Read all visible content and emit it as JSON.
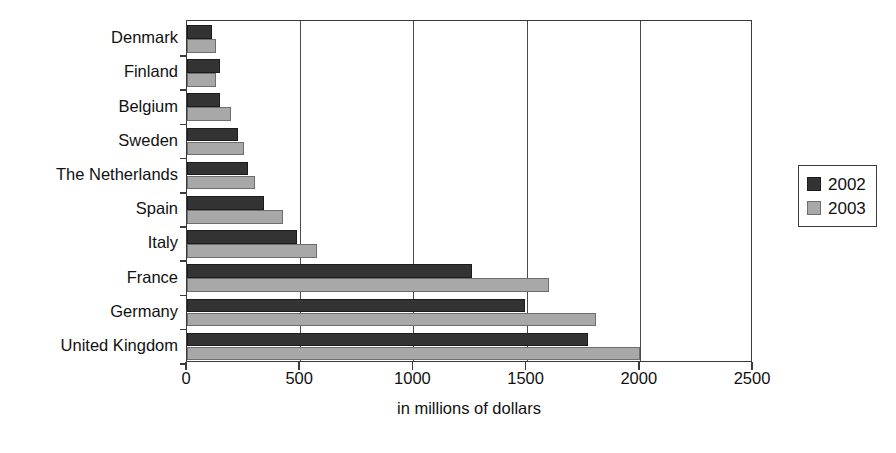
{
  "chart_data": {
    "type": "bar",
    "orientation": "horizontal",
    "title": "",
    "xlabel": "in millions of dollars",
    "ylabel": "",
    "xlim": [
      0,
      2500
    ],
    "xticks": [
      0,
      500,
      1000,
      1500,
      2000,
      2500
    ],
    "xtick_labels": [
      "0",
      "500",
      "1000",
      "1500",
      "2000",
      "2500"
    ],
    "grid": true,
    "legend_position": "right",
    "categories": [
      "Denmark",
      "Finland",
      "Belgium",
      "Sweden",
      "The Netherlands",
      "Spain",
      "Italy",
      "France",
      "Germany",
      "United Kingdom"
    ],
    "series": [
      {
        "name": "2002",
        "color": "#333333",
        "values": [
          110,
          145,
          145,
          225,
          270,
          340,
          485,
          1260,
          1495,
          1770
        ]
      },
      {
        "name": "2003",
        "color": "#a8a8a8",
        "values": [
          130,
          130,
          195,
          250,
          300,
          425,
          575,
          1600,
          1805,
          2000
        ]
      }
    ]
  },
  "legend": {
    "entries": [
      {
        "label": "2002",
        "swatch": "dark-swatch"
      },
      {
        "label": "2003",
        "swatch": "light-swatch"
      }
    ]
  },
  "colors": {
    "series_2002": "#333333",
    "series_2003": "#a8a8a8",
    "axis": "#3a3a3a",
    "background": "#ffffff"
  }
}
